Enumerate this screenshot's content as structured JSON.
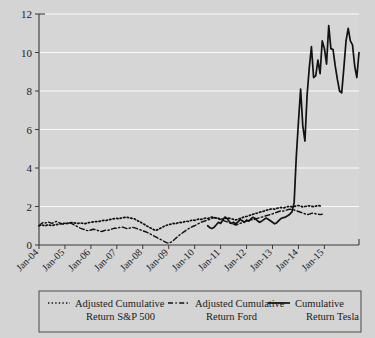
{
  "chart_data": {
    "type": "line",
    "title": "",
    "xlabel": "",
    "ylabel": "",
    "ylim": [
      0,
      12
    ],
    "yticks": [
      0,
      2,
      4,
      6,
      8,
      10,
      12
    ],
    "grid": true,
    "legend_position": "bottom",
    "xtick_labels": [
      "Jan-04",
      "Jan-05",
      "Jan-06",
      "Jan-07",
      "Jan-08",
      "Jan-09",
      "Jan-10",
      "Jan-11",
      "Jan-12",
      "Jan-13",
      "Jan-14",
      "Jan-15"
    ],
    "x_start": "Jan-04",
    "x_end": "Dec-15",
    "series": [
      {
        "name": "Adjusted Cumulative Return S&P 500",
        "style": "dotted",
        "color": "#111111",
        "x_start_index": 0,
        "values": [
          1.0,
          1.04,
          1.02,
          1.0,
          1.05,
          1.03,
          1.01,
          1.04,
          1.06,
          1.08,
          1.1,
          1.12,
          1.13,
          1.11,
          1.14,
          1.16,
          1.15,
          1.13,
          1.12,
          1.14,
          1.13,
          1.11,
          1.13,
          1.16,
          1.18,
          1.2,
          1.22,
          1.21,
          1.23,
          1.26,
          1.28,
          1.27,
          1.3,
          1.33,
          1.35,
          1.37,
          1.38,
          1.36,
          1.4,
          1.42,
          1.44,
          1.43,
          1.41,
          1.38,
          1.36,
          1.3,
          1.24,
          1.18,
          1.12,
          1.05,
          0.98,
          0.92,
          0.86,
          0.8,
          0.76,
          0.8,
          0.86,
          0.92,
          0.98,
          1.02,
          1.06,
          1.08,
          1.12,
          1.1,
          1.14,
          1.18,
          1.16,
          1.2,
          1.24,
          1.22,
          1.26,
          1.3,
          1.28,
          1.32,
          1.35,
          1.33,
          1.36,
          1.4,
          1.38,
          1.42,
          1.45,
          1.43,
          1.4,
          1.38,
          1.36,
          1.34,
          1.38,
          1.41,
          1.39,
          1.36,
          1.33,
          1.3,
          1.34,
          1.38,
          1.42,
          1.46,
          1.48,
          1.52,
          1.56,
          1.6,
          1.63,
          1.66,
          1.7,
          1.73,
          1.76,
          1.8,
          1.83,
          1.86,
          1.88,
          1.86,
          1.9,
          1.93,
          1.95,
          1.92,
          1.96,
          1.99,
          2.01,
          1.98,
          2.0,
          2.03,
          2.05,
          2.02,
          1.98,
          2.0,
          2.02,
          2.04,
          2.01,
          1.99,
          2.02,
          2.05,
          2.03,
          2.0
        ]
      },
      {
        "name": "Adjusted Cumulative Return Ford",
        "style": "dashed",
        "color": "#111111",
        "x_start_index": 0,
        "values": [
          1.0,
          1.1,
          1.18,
          1.14,
          1.2,
          1.16,
          1.12,
          1.18,
          1.22,
          1.18,
          1.12,
          1.08,
          1.1,
          1.14,
          1.16,
          1.12,
          1.06,
          1.0,
          0.94,
          0.88,
          0.84,
          0.8,
          0.76,
          0.74,
          0.78,
          0.82,
          0.8,
          0.76,
          0.72,
          0.7,
          0.74,
          0.78,
          0.76,
          0.8,
          0.84,
          0.88,
          0.86,
          0.9,
          0.94,
          0.92,
          0.88,
          0.84,
          0.88,
          0.92,
          0.9,
          0.86,
          0.82,
          0.78,
          0.74,
          0.7,
          0.66,
          0.6,
          0.54,
          0.48,
          0.42,
          0.36,
          0.3,
          0.24,
          0.18,
          0.12,
          0.1,
          0.14,
          0.22,
          0.32,
          0.42,
          0.52,
          0.6,
          0.68,
          0.76,
          0.84,
          0.9,
          0.96,
          1.0,
          1.06,
          1.12,
          1.18,
          1.22,
          1.26,
          1.3,
          1.34,
          1.38,
          1.42,
          1.4,
          1.36,
          1.32,
          1.28,
          1.24,
          1.2,
          1.16,
          1.12,
          1.08,
          1.04,
          1.08,
          1.12,
          1.16,
          1.2,
          1.24,
          1.28,
          1.32,
          1.3,
          1.34,
          1.38,
          1.42,
          1.45,
          1.48,
          1.52,
          1.55,
          1.58,
          1.62,
          1.66,
          1.7,
          1.74,
          1.78,
          1.76,
          1.8,
          1.83,
          1.86,
          1.84,
          1.82,
          1.78,
          1.74,
          1.7,
          1.66,
          1.62,
          1.58,
          1.6,
          1.64,
          1.66,
          1.62,
          1.6,
          1.58,
          1.6
        ]
      },
      {
        "name": "Cumulative Return Tesla",
        "style": "solid",
        "color": "#111111",
        "x_start_index": 78,
        "values": [
          1.0,
          0.9,
          0.86,
          0.92,
          1.05,
          1.18,
          1.12,
          1.3,
          1.45,
          1.38,
          1.22,
          1.12,
          1.18,
          1.1,
          1.2,
          1.32,
          1.26,
          1.18,
          1.3,
          1.24,
          1.36,
          1.44,
          1.38,
          1.26,
          1.18,
          1.24,
          1.32,
          1.4,
          1.34,
          1.26,
          1.18,
          1.1,
          1.16,
          1.28,
          1.38,
          1.42,
          1.45,
          1.52,
          1.6,
          1.72,
          2.2,
          4.6,
          6.4,
          8.1,
          6.2,
          5.4,
          7.8,
          9.2,
          10.3,
          8.7,
          8.8,
          9.6,
          8.9,
          10.6,
          10.2,
          9.4,
          11.4,
          10.2,
          10.15,
          9.3,
          8.6,
          8.0,
          7.9,
          9.2,
          10.6,
          11.25,
          10.6,
          10.4,
          9.3,
          8.7,
          10.0
        ]
      }
    ]
  },
  "legend": {
    "entries": [
      {
        "line1": "Adjusted Cumulative",
        "line2": "Return S&P 500",
        "style": "dotted"
      },
      {
        "line1": "Adjusted Cumulative",
        "line2": "Return Ford",
        "style": "dashed"
      },
      {
        "line1": "Cumulative",
        "line2": "Return Tesla",
        "style": "solid"
      }
    ]
  }
}
